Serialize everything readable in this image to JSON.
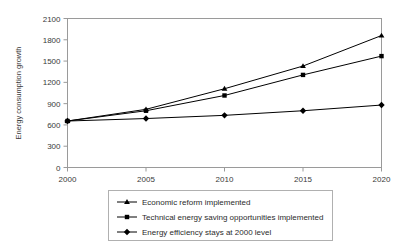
{
  "chart_data": {
    "type": "line",
    "title": "",
    "xlabel": "",
    "ylabel": "Energy consumption growth",
    "categories": [
      "2000",
      "2005",
      "2010",
      "2015",
      "2020"
    ],
    "x": [
      2000,
      2005,
      2010,
      2015,
      2020
    ],
    "xlim": [
      2000,
      2020
    ],
    "ylim": [
      0,
      2100
    ],
    "yticks": [
      "0",
      "300",
      "600",
      "900",
      "1200",
      "1500",
      "1800",
      "2100"
    ],
    "ytick_values": [
      0,
      300,
      600,
      900,
      1200,
      1500,
      1800,
      2100
    ],
    "grid": false,
    "legend_position": "bottom",
    "series": [
      {
        "name": "Economic reform implemented",
        "marker": "triangle",
        "color": "#000000",
        "values": [
          655,
          820,
          1110,
          1430,
          1860
        ]
      },
      {
        "name": "Technical energy saving opportunities implemented",
        "marker": "square",
        "color": "#000000",
        "values": [
          655,
          800,
          1015,
          1305,
          1570
        ]
      },
      {
        "name": "Energy efficiency stays at 2000 level",
        "marker": "diamond",
        "color": "#000000",
        "values": [
          655,
          690,
          735,
          800,
          880
        ]
      }
    ]
  },
  "axes": {
    "y_title": "Energy consumption growth"
  },
  "legend": {
    "items": [
      {
        "label": "Economic reform implemented",
        "marker": "triangle"
      },
      {
        "label": "Technical energy saving opportunities implemented",
        "marker": "square"
      },
      {
        "label": "Energy efficiency stays at 2000 level",
        "marker": "diamond"
      }
    ]
  },
  "colors": {
    "line": "#000000",
    "frame": "#9a9a9a",
    "text": "#3a3a3a",
    "background": "#ffffff"
  }
}
